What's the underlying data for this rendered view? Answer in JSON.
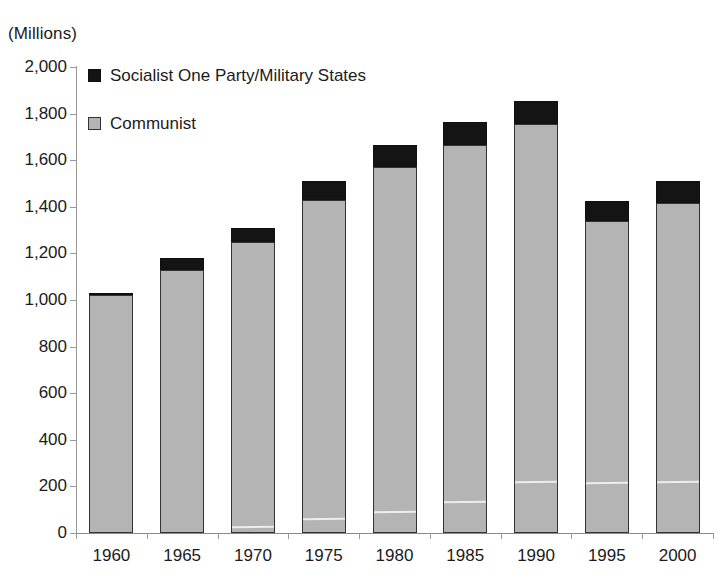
{
  "unit_caption": "(Millions)",
  "legend": {
    "position": "inside-top-left",
    "items": [
      {
        "label": "Socialist One Party/Military States",
        "color": "#141414",
        "swatch_name": "legend-swatch-socialist"
      },
      {
        "label": "Communist",
        "color": "#b4b4b4",
        "swatch_name": "legend-swatch-communist"
      }
    ]
  },
  "chart_data": {
    "type": "bar",
    "stacked": true,
    "title": "",
    "subtitle": "",
    "xlabel": "",
    "ylabel": "(Millions)",
    "ylim": [
      0,
      2000
    ],
    "ytick_step": 200,
    "grid": false,
    "legend_position": "inside-top-left",
    "categories": [
      "1960",
      "1965",
      "1970",
      "1975",
      "1980",
      "1985",
      "1990",
      "1995",
      "2000"
    ],
    "ytick_labels": [
      "0",
      "200",
      "400",
      "600",
      "800",
      "1,000",
      "1,200",
      "1,400",
      "1,600",
      "1,800",
      "2,000"
    ],
    "ytick_values": [
      0,
      200,
      400,
      600,
      800,
      1000,
      1200,
      1400,
      1600,
      1800,
      2000
    ],
    "series": [
      {
        "name": "Communist",
        "color": "#b4b4b4",
        "values": [
          1020,
          1130,
          1250,
          1430,
          1570,
          1665,
          1755,
          1340,
          1415
        ]
      },
      {
        "name": "Socialist One Party/Military States",
        "color": "#141414",
        "values": [
          10,
          50,
          60,
          80,
          95,
          100,
          100,
          85,
          95
        ]
      }
    ],
    "totals": [
      1030,
      1180,
      1310,
      1510,
      1665,
      1765,
      1855,
      1425,
      1510
    ]
  }
}
